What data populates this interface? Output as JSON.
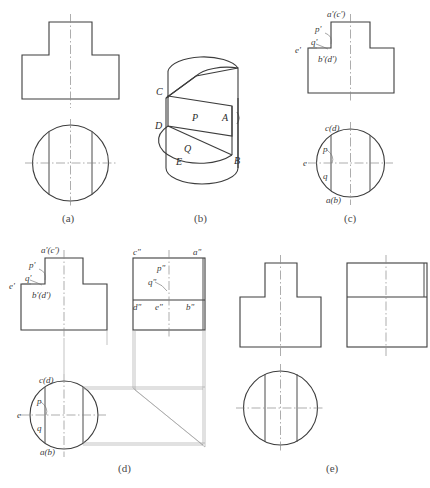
{
  "sheet": {
    "title": "Orthographic projection exercise — cylinder with T-shaped prism cut",
    "background_color": "#ffffff",
    "line_color": "#3d3d3d",
    "centerline_color": "#8a8a8a"
  },
  "captions": [
    {
      "key": "a",
      "label": "(a)"
    },
    {
      "key": "b",
      "label": "(b)"
    },
    {
      "key": "c",
      "label": "(c)"
    },
    {
      "key": "d",
      "label": "(d)"
    },
    {
      "key": "e",
      "label": "(e)"
    }
  ],
  "figures": {
    "a": {
      "caption": "(a)",
      "description": "Front view T-shape above top view circle, no point labels",
      "views": [
        "front-view",
        "top-view"
      ]
    },
    "b": {
      "caption": "(b)",
      "description": "Isometric pictorial of cylinder with flat cut surfaces P and Q",
      "labels": [
        {
          "text": "C",
          "name": "point-c"
        },
        {
          "text": "D",
          "name": "point-d"
        },
        {
          "text": "P",
          "name": "face-p"
        },
        {
          "text": "A",
          "name": "point-a"
        },
        {
          "text": "Q",
          "name": "face-q"
        },
        {
          "text": "E",
          "name": "point-e"
        },
        {
          "text": "B",
          "name": "point-b"
        }
      ]
    },
    "c": {
      "caption": "(c)",
      "description": "Front view and top view with projection point labels",
      "front_labels": [
        {
          "text": "a'(c')",
          "name": "label-a-prime-c-prime"
        },
        {
          "text": "p'",
          "name": "label-p-prime"
        },
        {
          "text": "q'",
          "name": "label-q-prime"
        },
        {
          "text": "e'",
          "name": "label-e-prime"
        },
        {
          "text": "b'(d')",
          "name": "label-b-prime-d-prime"
        }
      ],
      "top_labels": [
        {
          "text": "c(d)",
          "name": "label-c-d"
        },
        {
          "text": "p",
          "name": "label-p"
        },
        {
          "text": "e",
          "name": "label-e"
        },
        {
          "text": "q",
          "name": "label-q"
        },
        {
          "text": "a(b)",
          "name": "label-a-b"
        }
      ]
    },
    "d": {
      "caption": "(d)",
      "description": "Three-view layout with 45 degree miter line projection construction",
      "front_labels": [
        {
          "text": "a'(c')",
          "name": "label-a-prime-c-prime"
        },
        {
          "text": "p'",
          "name": "label-p-prime"
        },
        {
          "text": "q'",
          "name": "label-q-prime"
        },
        {
          "text": "e'",
          "name": "label-e-prime"
        },
        {
          "text": "b'(d')",
          "name": "label-b-prime-d-prime"
        }
      ],
      "side_labels": [
        {
          "text": "c\"",
          "name": "label-c-double-prime"
        },
        {
          "text": "a\"",
          "name": "label-a-double-prime"
        },
        {
          "text": "p\"",
          "name": "label-p-double-prime"
        },
        {
          "text": "q\"",
          "name": "label-q-double-prime"
        },
        {
          "text": "d\"",
          "name": "label-d-double-prime"
        },
        {
          "text": "e\"",
          "name": "label-e-double-prime"
        },
        {
          "text": "b\"",
          "name": "label-b-double-prime"
        }
      ],
      "top_labels": [
        {
          "text": "c(d)",
          "name": "label-c-d"
        },
        {
          "text": "p",
          "name": "label-p"
        },
        {
          "text": "e",
          "name": "label-e"
        },
        {
          "text": "q",
          "name": "label-q"
        },
        {
          "text": "a(b)",
          "name": "label-a-b"
        }
      ]
    },
    "e": {
      "caption": "(e)",
      "description": "Completed three views: front T-shape, side rectangle with horizontal edge, top circle",
      "views": [
        "front-view",
        "side-view",
        "top-view"
      ]
    }
  }
}
